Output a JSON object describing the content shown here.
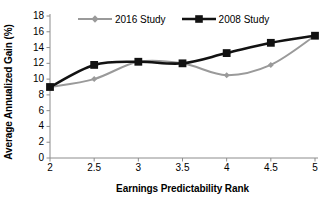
{
  "chart_data": {
    "type": "line",
    "title": "",
    "xlabel": "Earnings Predictability Rank",
    "ylabel": "Average Annualized Gain (%)",
    "x": [
      2,
      2.5,
      3,
      3.5,
      4,
      4.5,
      5
    ],
    "xtick_labels": [
      "2",
      "2.5",
      "3",
      "3.5",
      "4",
      "4.5",
      "5"
    ],
    "ytick_labels": [
      "0",
      "2",
      "4",
      "6",
      "8",
      "10",
      "12",
      "14",
      "16",
      "18"
    ],
    "ytick_values": [
      0,
      2,
      4,
      6,
      8,
      10,
      12,
      14,
      16,
      18
    ],
    "xlim": [
      2,
      5
    ],
    "ylim": [
      0,
      18
    ],
    "grid": false,
    "legend_position": "top-center",
    "smoothed": true,
    "series": [
      {
        "name": "2016 Study",
        "color": "#9a9a9a",
        "marker": "diamond",
        "values": [
          9.0,
          10.0,
          12.2,
          12.0,
          10.5,
          11.8,
          15.5
        ]
      },
      {
        "name": "2008 Study",
        "color": "#121212",
        "marker": "square",
        "values": [
          9.0,
          11.8,
          12.2,
          12.0,
          13.3,
          14.6,
          15.5
        ]
      }
    ]
  },
  "axis": {
    "line_color": "#8c8c8c",
    "tick_color": "#8c8c8c"
  }
}
